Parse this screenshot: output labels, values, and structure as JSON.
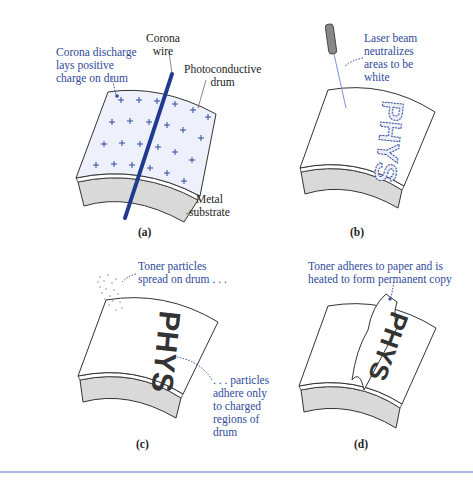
{
  "figure": {
    "panels": [
      {
        "id": "a",
        "caption": "(a)",
        "labels": {
          "corona_discharge": [
            "Corona discharge",
            "lays positive",
            "charge on drum"
          ],
          "corona_wire": [
            "Corona",
            "wire"
          ],
          "photoconductive_drum": [
            "Photoconductive",
            "drum"
          ],
          "metal_substrate": [
            "Metal",
            "substrate"
          ]
        }
      },
      {
        "id": "b",
        "caption": "(b)",
        "labels": {
          "laser_beam": [
            "Laser beam",
            "neutralizes",
            "areas to be",
            "white"
          ]
        },
        "drum_text": "PHYS"
      },
      {
        "id": "c",
        "caption": "(c)",
        "labels": {
          "toner_spread": [
            "Toner particles",
            "spread on drum . . ."
          ],
          "particles_adhere": [
            ". . . particles",
            "adhere only",
            "to charged",
            "regions of",
            "drum"
          ]
        },
        "drum_text": "PHYS"
      },
      {
        "id": "d",
        "caption": "(d)",
        "labels": {
          "toner_adheres": [
            "Toner adheres to paper and is",
            "heated to form permanent copy"
          ]
        },
        "paper_text": "PHYS"
      }
    ],
    "colors": {
      "annotation_blue": "#2f4a9a",
      "wire_blue": "#1f3a8f",
      "drum_tint": "#eef0fb",
      "substrate_gray": "#d9d9d9",
      "rule_blue": "#a9b4e0"
    }
  }
}
